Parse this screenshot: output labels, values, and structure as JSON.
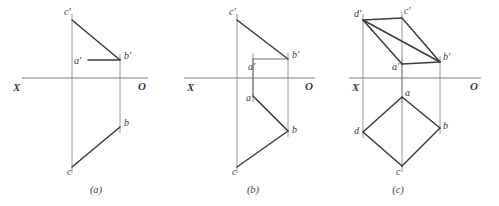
{
  "sheet": {
    "width": 499,
    "height": 206,
    "background": "#ffffff",
    "title": "Orthographic projection exercise — three part figure"
  },
  "style": {
    "edge_color": "#3b3b3b",
    "projector_color": "#8d8d8d",
    "axis_color": "#7e7e7e",
    "label_color": "#39393c"
  },
  "figures": [
    {
      "key": "a",
      "caption": "(a)",
      "caption_x": 96,
      "caption_y": 193,
      "axis": {
        "label_left": "X",
        "label_right": "O",
        "label_left_x": 13,
        "label_left_y": 91,
        "label_right_x": 138,
        "label_right_y": 90,
        "x1": 22,
        "y1": 78,
        "x2": 148,
        "y2": 78
      },
      "points": [
        {
          "id": "c-prime",
          "label": "c'",
          "x": 72,
          "y": 20,
          "lx": 64,
          "ly": 15
        },
        {
          "id": "b-prime",
          "label": "b'",
          "x": 120,
          "y": 60,
          "lx": 124,
          "ly": 59
        },
        {
          "id": "a-prime",
          "label": "a'",
          "x": 88,
          "y": 60,
          "lx": 74,
          "ly": 64
        },
        {
          "id": "b",
          "label": "b",
          "x": 120,
          "y": 127,
          "lx": 124,
          "ly": 126
        },
        {
          "id": "c",
          "label": "c",
          "x": 72,
          "y": 167,
          "lx": 67,
          "ly": 175
        }
      ],
      "edges": [
        {
          "from": "c-prime",
          "to": "b-prime",
          "weight": "heavy"
        },
        {
          "from": "a-prime",
          "to": "b-prime",
          "weight": "heavy"
        },
        {
          "from": "c",
          "to": "b",
          "weight": "heavy"
        }
      ],
      "projectors": [
        {
          "from": "c-prime",
          "to": "c"
        },
        {
          "from": "b-prime",
          "to": "b"
        }
      ]
    },
    {
      "key": "b",
      "caption": "(b)",
      "caption_x": 253,
      "caption_y": 193,
      "axis": {
        "label_left": "X",
        "label_right": "O",
        "label_left_x": 187,
        "label_left_y": 91,
        "label_right_x": 305,
        "label_right_y": 90,
        "x1": 184,
        "y1": 78,
        "x2": 315,
        "y2": 78
      },
      "points": [
        {
          "id": "c-prime",
          "label": "c'",
          "x": 237,
          "y": 20,
          "lx": 229,
          "ly": 15
        },
        {
          "id": "b-prime",
          "label": "b'",
          "x": 288,
          "y": 59,
          "lx": 292,
          "ly": 58
        },
        {
          "id": "a-prime",
          "label": "a'",
          "x": 253,
          "y": 59,
          "lx": 248,
          "ly": 70
        },
        {
          "id": "a",
          "label": "a",
          "x": 253,
          "y": 96,
          "lx": 246,
          "ly": 101
        },
        {
          "id": "b",
          "label": "b",
          "x": 288,
          "y": 131,
          "lx": 292,
          "ly": 133
        },
        {
          "id": "c",
          "label": "c",
          "x": 237,
          "y": 167,
          "lx": 232,
          "ly": 175
        }
      ],
      "edges": [
        {
          "from": "c-prime",
          "to": "b-prime",
          "weight": "heavy"
        },
        {
          "from": "a-prime",
          "to": "b-prime",
          "weight": "thin"
        },
        {
          "from": "a",
          "to": "b",
          "weight": "heavy"
        },
        {
          "from": "c",
          "to": "b",
          "weight": "heavy"
        }
      ],
      "projectors": [
        {
          "from": "c-prime",
          "to": "c"
        },
        {
          "from": "b-prime",
          "to": "b"
        },
        {
          "from": "a-prime",
          "to": "a"
        }
      ],
      "extra_segments": [
        {
          "x1": 253,
          "y1": 59,
          "x2": 253,
          "y2": 96,
          "weight": "thin"
        }
      ]
    },
    {
      "key": "c",
      "caption": "(c)",
      "caption_x": 398,
      "caption_y": 193,
      "axis": {
        "label_left": "X",
        "label_right": "O",
        "label_left_x": 352,
        "label_left_y": 91,
        "label_right_x": 470,
        "label_right_y": 90,
        "x1": 349,
        "y1": 78,
        "x2": 481,
        "y2": 78
      },
      "points": [
        {
          "id": "d-prime",
          "label": "d'",
          "x": 363,
          "y": 20,
          "lx": 354,
          "ly": 17
        },
        {
          "id": "c-prime",
          "label": "c'",
          "x": 402,
          "y": 18,
          "lx": 404,
          "ly": 14
        },
        {
          "id": "a-prime",
          "label": "a'",
          "x": 402,
          "y": 64,
          "lx": 392,
          "ly": 70
        },
        {
          "id": "b-prime",
          "label": "b'",
          "x": 440,
          "y": 62,
          "lx": 443,
          "ly": 60
        },
        {
          "id": "a",
          "label": "a",
          "x": 402,
          "y": 97,
          "lx": 405,
          "ly": 96
        },
        {
          "id": "d",
          "label": "d",
          "x": 363,
          "y": 132,
          "lx": 354,
          "ly": 134
        },
        {
          "id": "b",
          "label": "b",
          "x": 440,
          "y": 128,
          "lx": 443,
          "ly": 129
        },
        {
          "id": "c",
          "label": "c",
          "x": 402,
          "y": 166,
          "lx": 396,
          "ly": 175
        }
      ],
      "edges": [
        {
          "from": "d-prime",
          "to": "c-prime",
          "weight": "heavy"
        },
        {
          "from": "c-prime",
          "to": "b-prime",
          "weight": "heavy"
        },
        {
          "from": "d-prime",
          "to": "a-prime",
          "weight": "heavy"
        },
        {
          "from": "a-prime",
          "to": "b-prime",
          "weight": "heavy"
        },
        {
          "from": "d-prime",
          "to": "b-prime",
          "weight": "heavy"
        },
        {
          "from": "a",
          "to": "d",
          "weight": "heavy"
        },
        {
          "from": "d",
          "to": "c",
          "weight": "heavy"
        },
        {
          "from": "c",
          "to": "b",
          "weight": "heavy"
        },
        {
          "from": "b",
          "to": "a",
          "weight": "heavy"
        }
      ],
      "projectors": [
        {
          "from": "d-prime",
          "to": "d"
        },
        {
          "from": "c-prime",
          "to": "c"
        },
        {
          "from": "b-prime",
          "to": "b"
        },
        {
          "from": "a-prime",
          "to": "a"
        }
      ]
    }
  ]
}
